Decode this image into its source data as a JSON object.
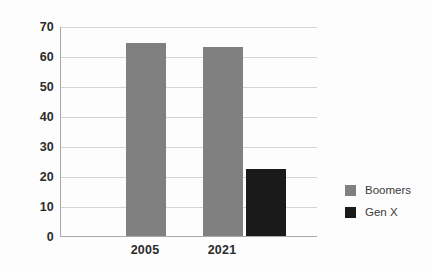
{
  "chart_data": {
    "type": "bar",
    "title": "",
    "subtitle": "",
    "xlabel": "",
    "ylabel": "",
    "categories": [
      "2005",
      "2021"
    ],
    "series": [
      {
        "name": "Boomers",
        "color": "#808080",
        "values": [
          64.5,
          63
        ]
      },
      {
        "name": "Gen X",
        "color": "#1a1a1a",
        "values": [
          null,
          22.5
        ]
      }
    ],
    "ylim": [
      0,
      70
    ],
    "ytick_values": [
      0,
      10,
      20,
      30,
      40,
      50,
      60,
      70
    ],
    "ytick_labels": [
      "0",
      "10",
      "20",
      "30",
      "40",
      "50",
      "60",
      "70"
    ],
    "grid": true,
    "grid_axis": "y",
    "legend_position": "right",
    "legend_entries": [
      {
        "label": "Boomers",
        "color": "#808080"
      },
      {
        "label": "Gen X",
        "color": "#1a1a1a"
      }
    ],
    "annotations": [],
    "background_color": "#fdfdfd",
    "gridline_color": "#d3d3d6",
    "axis_color": "#a9a9ad",
    "tick_label_color": "#2b2b2b"
  }
}
